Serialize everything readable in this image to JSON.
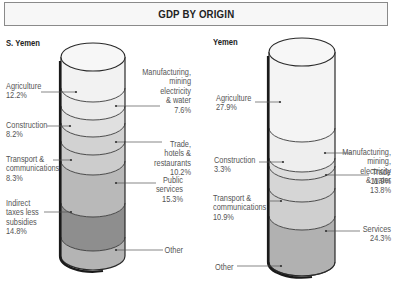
{
  "title": "GDP BY ORIGIN",
  "chart_data": [
    {
      "type": "stacked-cylinder",
      "title": "S. Yemen",
      "unit": "% of GDP",
      "segments_top_to_bottom": [
        {
          "name": "Agriculture",
          "value": 12.2,
          "side": "left",
          "lines": [
            "Agriculture",
            "12.2%"
          ]
        },
        {
          "name": "Manufacturing, mining electricity & water",
          "value": 7.6,
          "side": "right",
          "lines": [
            "Manufacturing,",
            "mining",
            "electricity",
            "& water",
            "7.6%"
          ]
        },
        {
          "name": "Construction",
          "value": 8.2,
          "side": "left",
          "lines": [
            "Construction",
            "8.2%"
          ]
        },
        {
          "name": "Trade, hotels & restaurants",
          "value": 10.2,
          "side": "right",
          "lines": [
            "Trade,",
            "hotels &",
            "restaurants",
            "10.2%"
          ]
        },
        {
          "name": "Transport & communications",
          "value": 8.3,
          "side": "left",
          "lines": [
            "Transport &",
            "communications",
            "8.3%"
          ]
        },
        {
          "name": "Public services",
          "value": 15.3,
          "side": "right",
          "lines": [
            "Public",
            "services",
            "15.3%"
          ]
        },
        {
          "name": "Indirect taxes less subsidies",
          "value": 14.8,
          "side": "left",
          "lines": [
            "Indirect",
            "taxes less",
            "subsidies",
            "14.8%"
          ]
        },
        {
          "name": "Other",
          "value": 23.4,
          "side": "right",
          "lines": [
            "Other"
          ]
        }
      ]
    },
    {
      "type": "stacked-cylinder",
      "title": "Yemen",
      "unit": "% of GDP",
      "segments_top_to_bottom": [
        {
          "name": "Agriculture",
          "value": 27.9,
          "side": "left",
          "lines": [
            "Agriculture",
            "27.9%"
          ]
        },
        {
          "name": "Manufacturing, mining, electricity & water",
          "value": 13.8,
          "side": "right",
          "lines": [
            "Manufacturing,",
            "mining,",
            "electricity",
            "& water",
            "13.8%"
          ]
        },
        {
          "name": "Construction",
          "value": 3.3,
          "side": "left",
          "lines": [
            "Construction",
            "3.3%"
          ]
        },
        {
          "name": "Trade",
          "value": 11.9,
          "side": "right",
          "lines": [
            "Trade",
            "11.9%"
          ]
        },
        {
          "name": "Transport & communications",
          "value": 10.9,
          "side": "left",
          "lines": [
            "Transport &",
            "communications",
            "10.9%"
          ]
        },
        {
          "name": "Services",
          "value": 24.3,
          "side": "right",
          "lines": [
            "Services",
            "24.3%"
          ]
        },
        {
          "name": "Other",
          "value": 7.9,
          "side": "left",
          "lines": [
            "Other"
          ]
        }
      ]
    }
  ],
  "layout": {
    "cylinders": [
      {
        "cx": 93,
        "rx": 32,
        "ry": 14,
        "top": 57,
        "bottom": 270,
        "boundaries": [
          57,
          88,
          106,
          123,
          141,
          161,
          203,
          237,
          270
        ],
        "fills": [
          "#f2f2f2",
          "#ebebeb",
          "#e0e0e0",
          "#d2d2d2",
          "#cccccc",
          "#b9b9b9",
          "#8e8e8e",
          "#b4b4b4"
        ],
        "title_pos": [
          6,
          47
        ],
        "labels": [
          {
            "x": 6,
            "y": 89,
            "anchor": "start",
            "dot": [
              76,
              92
            ],
            "line": [
              41,
              92
            ]
          },
          {
            "x": 191,
            "y": 75,
            "anchor": "end",
            "dot": [
              116,
              106
            ],
            "line": [
              160,
              106
            ]
          },
          {
            "x": 6,
            "y": 128,
            "anchor": "start",
            "dot": [
              70,
              126
            ],
            "line": [
              47,
              126
            ]
          },
          {
            "x": 191,
            "y": 147,
            "anchor": "end",
            "dot": [
              116,
              142
            ],
            "line": [
              162,
              142
            ]
          },
          {
            "x": 6,
            "y": 162,
            "anchor": "start",
            "dot": [
              71,
              160
            ],
            "line": [
              53,
              160
            ]
          },
          {
            "x": 183,
            "y": 183,
            "anchor": "end",
            "dot": [
              116,
              183
            ],
            "line": [
              156,
              183
            ]
          },
          {
            "x": 6,
            "y": 206,
            "anchor": "start",
            "dot": [
              71,
              212
            ],
            "line": [
              44,
              212
            ]
          },
          {
            "x": 183,
            "y": 253,
            "anchor": "end",
            "dot": [
              116,
              250
            ],
            "line": [
              163,
              250
            ]
          }
        ]
      },
      {
        "cx": 302,
        "rx": 33,
        "ry": 14,
        "top": 52,
        "bottom": 268,
        "boundaries": [
          52,
          128,
          158,
          166,
          188,
          216,
          262,
          276
        ],
        "fills": [
          "#f4f4f4",
          "#eeeeee",
          "#dddddd",
          "#d6d6d6",
          "#cfcfcf",
          "#b1b1b1",
          "#bbbbbb"
        ],
        "title_pos": [
          213,
          46
        ],
        "labels": [
          {
            "x": 216,
            "y": 101,
            "anchor": "start",
            "dot": [
              280,
              102
            ],
            "line": [
              255,
              102
            ]
          },
          {
            "x": 391,
            "y": 155,
            "anchor": "end",
            "dot": [
              325,
              153
            ],
            "line": [
              352,
              153
            ]
          },
          {
            "x": 214,
            "y": 163,
            "anchor": "start",
            "dot": [
              283,
              162
            ],
            "line": [
              259,
              162
            ]
          },
          {
            "x": 391,
            "y": 175,
            "anchor": "end",
            "dot": [
              326,
              175
            ],
            "line": [
              369,
              175
            ]
          },
          {
            "x": 213,
            "y": 201,
            "anchor": "start",
            "dot": [
              281,
              201
            ],
            "line": [
              270,
              201
            ]
          },
          {
            "x": 391,
            "y": 232,
            "anchor": "end",
            "dot": [
              326,
              231
            ],
            "line": [
              360,
              231
            ]
          },
          {
            "x": 215,
            "y": 270,
            "anchor": "start",
            "dot": [
              281,
              266
            ],
            "line": [
              237,
              266
            ]
          }
        ]
      }
    ]
  }
}
